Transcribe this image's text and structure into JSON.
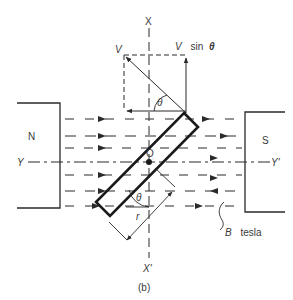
{
  "figure": {
    "caption": "(b)"
  },
  "axes": {
    "vertical_top": "X",
    "vertical_bottom": "X'",
    "horizontal_left": "Y",
    "horizontal_right": "Y'"
  },
  "magnets": {
    "north": {
      "label": "N"
    },
    "south": {
      "label": "S"
    }
  },
  "field": {
    "label_symbol": "B",
    "label_unit": "tesla",
    "rows": 6
  },
  "coil": {
    "center_label": "O",
    "radius_label": "r",
    "angle_label_upper": "θ",
    "angle_label_lower": "θ"
  },
  "velocity": {
    "vector_label": "V",
    "component_label_prefix": "V",
    "component_label_func": "sin",
    "component_label_angle": "θ"
  },
  "colors": {
    "ink": "#2a2a2a",
    "text": "#3a3a3a",
    "background": "#ffffff"
  }
}
